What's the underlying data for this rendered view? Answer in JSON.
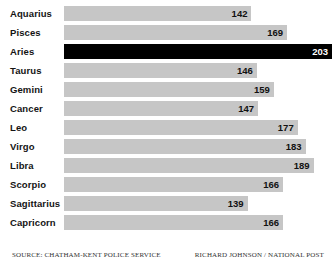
{
  "footer": {
    "source": "SOURCE: CHATHAM-KENT POLICE SERVICE",
    "credit": "RICHARD JOHNSON / NATIONAL POST"
  },
  "colors": {
    "bar": "#c6c6c6",
    "bar_highlight": "#000000",
    "label": "#141414",
    "value": "#111111",
    "value_highlight": "#ffffff",
    "background": "#ffffff"
  },
  "chart_data": {
    "type": "bar",
    "orientation": "horizontal",
    "title": "",
    "subtitle": "",
    "xlabel": "",
    "ylabel": "",
    "grid": false,
    "legend": "none",
    "xlim": [
      0,
      203
    ],
    "highlight_category": "Aries",
    "categories": [
      "Aquarius",
      "Pisces",
      "Aries",
      "Taurus",
      "Gemini",
      "Cancer",
      "Leo",
      "Virgo",
      "Libra",
      "Scorpio",
      "Sagittarius",
      "Capricorn"
    ],
    "values": [
      142,
      169,
      203,
      146,
      159,
      147,
      177,
      183,
      189,
      166,
      139,
      166
    ],
    "bars": [
      {
        "label": "Aquarius",
        "value": 142,
        "value_text": "142",
        "highlight": false
      },
      {
        "label": "Pisces",
        "value": 169,
        "value_text": "169",
        "highlight": false
      },
      {
        "label": "Aries",
        "value": 203,
        "value_text": "203",
        "highlight": true
      },
      {
        "label": "Taurus",
        "value": 146,
        "value_text": "146",
        "highlight": false
      },
      {
        "label": "Gemini",
        "value": 159,
        "value_text": "159",
        "highlight": false
      },
      {
        "label": "Cancer",
        "value": 147,
        "value_text": "147",
        "highlight": false
      },
      {
        "label": "Leo",
        "value": 177,
        "value_text": "177",
        "highlight": false
      },
      {
        "label": "Virgo",
        "value": 183,
        "value_text": "183",
        "highlight": false
      },
      {
        "label": "Libra",
        "value": 189,
        "value_text": "189",
        "highlight": false
      },
      {
        "label": "Scorpio",
        "value": 166,
        "value_text": "166",
        "highlight": false
      },
      {
        "label": "Sagittarius",
        "value": 139,
        "value_text": "139",
        "highlight": false
      },
      {
        "label": "Capricorn",
        "value": 166,
        "value_text": "166",
        "highlight": false
      }
    ]
  }
}
